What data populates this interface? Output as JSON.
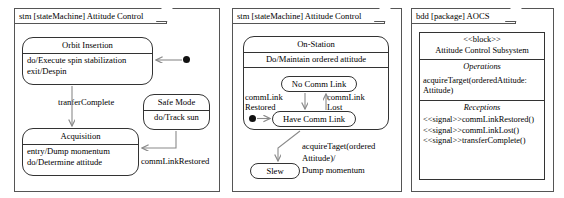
{
  "panels": {
    "stm_left": {
      "header": "stm [stateMachine] Attitude Control",
      "states": {
        "orbit_insertion": {
          "name": "Orbit Insertion",
          "body_line1": "do/Execute spin stabilization",
          "body_line2": "exit/Despin"
        },
        "acquisition": {
          "name": "Acquisition",
          "body_line1": "entry/Dump momentum",
          "body_line2": "do/Determine attitude"
        },
        "safe_mode": {
          "name": "Safe Mode",
          "body_line1": "do/Track sun"
        }
      },
      "transitions": {
        "transfer_complete": "tranferComplete",
        "comm_link_restored": "commLinkRestored"
      }
    },
    "stm_right": {
      "header": "stm [stateMachine] Attitude Control",
      "states": {
        "on_station": {
          "name": "On-Station",
          "body_line1": "Do/Maintain ordered attitude"
        },
        "no_comm_link": {
          "name": "No Comm Link"
        },
        "have_comm_link": {
          "name": "Have Comm Link"
        },
        "slew": {
          "name": "Slew"
        }
      },
      "transitions": {
        "comm_link_restored_l1": "commLink",
        "comm_link_restored_l2": "Restored",
        "comm_link_lost_l1": "commLink",
        "comm_link_lost_l2": "Lost",
        "acquire_target_l1": "acquireTaget(ordered",
        "acquire_target_l2": "Attitude)/",
        "acquire_target_l3": "Dump momentum"
      }
    },
    "bdd": {
      "header": "bdd [package] AOCS",
      "block": {
        "stereotype": "<<block>>",
        "name": "Attitude Control Subsystem",
        "operations_label": "Operations",
        "operations": [
          "acquireTarget(orderedAttitude:",
          "Attitude)"
        ],
        "receptions_label": "Receptions",
        "receptions": [
          "<<signal>>commLinkRestored()",
          "<<signal>>commLinkLost()",
          "<<signal>>transferComplete()"
        ]
      }
    }
  },
  "colors": {
    "frame_border": "#555555",
    "state_border": "#333333",
    "arrow": "#8a8a8a",
    "background": "#ffffff",
    "initial_node": "#111111"
  }
}
